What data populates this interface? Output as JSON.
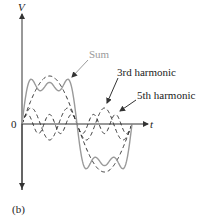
{
  "figure": {
    "panel_label": "(b)",
    "axes": {
      "y_label": "V",
      "x_label": "t",
      "origin_label": "0"
    },
    "annotations": {
      "sum": "Sum",
      "third": "3rd harmonic",
      "fifth": "5th harmonic"
    },
    "colors": {
      "sum": "#9a9a9a",
      "harmonics": "#333333",
      "axes": "#333333"
    }
  }
}
